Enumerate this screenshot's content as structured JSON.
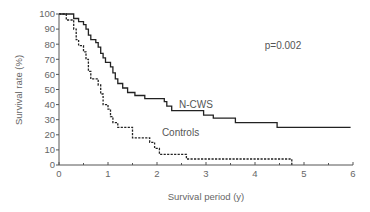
{
  "chart_data": {
    "type": "line",
    "subtype": "kaplan-meier step",
    "title": "",
    "xlabel": "Survival period (y)",
    "ylabel": "Survival rate (%)",
    "xlim": [
      0,
      6
    ],
    "ylim": [
      0,
      100
    ],
    "x_ticks": [
      0,
      1,
      2,
      3,
      4,
      5,
      6
    ],
    "x_minor_ticks": [
      0.5,
      1.5,
      2.5,
      3.5,
      4.5,
      5.5
    ],
    "y_ticks": [
      0,
      10,
      20,
      30,
      40,
      50,
      60,
      70,
      80,
      90,
      100
    ],
    "grid": false,
    "legend": "inline labels",
    "annotations": [
      {
        "text": "p=0.002",
        "x": 4.2,
        "y": 77
      }
    ],
    "series": [
      {
        "name": "N-CWS",
        "style": "solid",
        "color": "#222222",
        "label_pos": {
          "x": 2.45,
          "y": 38
        },
        "points": [
          [
            0,
            100
          ],
          [
            0.3,
            100
          ],
          [
            0.3,
            97
          ],
          [
            0.4,
            97
          ],
          [
            0.4,
            95
          ],
          [
            0.5,
            95
          ],
          [
            0.5,
            93
          ],
          [
            0.55,
            93
          ],
          [
            0.55,
            90
          ],
          [
            0.6,
            90
          ],
          [
            0.6,
            86
          ],
          [
            0.65,
            86
          ],
          [
            0.65,
            83
          ],
          [
            0.75,
            83
          ],
          [
            0.75,
            81
          ],
          [
            0.8,
            81
          ],
          [
            0.8,
            78
          ],
          [
            0.85,
            78
          ],
          [
            0.85,
            74
          ],
          [
            0.9,
            74
          ],
          [
            0.9,
            71
          ],
          [
            0.95,
            71
          ],
          [
            0.95,
            68
          ],
          [
            1.05,
            68
          ],
          [
            1.05,
            65
          ],
          [
            1.1,
            65
          ],
          [
            1.1,
            61
          ],
          [
            1.15,
            61
          ],
          [
            1.15,
            57
          ],
          [
            1.2,
            57
          ],
          [
            1.2,
            54
          ],
          [
            1.3,
            54
          ],
          [
            1.3,
            51
          ],
          [
            1.4,
            51
          ],
          [
            1.4,
            48
          ],
          [
            1.55,
            48
          ],
          [
            1.55,
            46
          ],
          [
            1.75,
            46
          ],
          [
            1.75,
            44
          ],
          [
            2.15,
            44
          ],
          [
            2.15,
            42
          ],
          [
            2.2,
            42
          ],
          [
            2.2,
            39
          ],
          [
            2.3,
            39
          ],
          [
            2.3,
            36
          ],
          [
            2.95,
            36
          ],
          [
            2.95,
            33
          ],
          [
            3.15,
            33
          ],
          [
            3.15,
            31
          ],
          [
            3.6,
            31
          ],
          [
            3.6,
            28
          ],
          [
            4.45,
            28
          ],
          [
            4.45,
            25
          ],
          [
            5.95,
            25
          ]
        ]
      },
      {
        "name": "Controls",
        "style": "dashed",
        "color": "#222222",
        "label_pos": {
          "x": 2.1,
          "y": 19
        },
        "points": [
          [
            0,
            100
          ],
          [
            0.15,
            100
          ],
          [
            0.15,
            96
          ],
          [
            0.3,
            96
          ],
          [
            0.3,
            90
          ],
          [
            0.35,
            90
          ],
          [
            0.35,
            83
          ],
          [
            0.4,
            83
          ],
          [
            0.4,
            79
          ],
          [
            0.5,
            79
          ],
          [
            0.5,
            75
          ],
          [
            0.55,
            75
          ],
          [
            0.55,
            70
          ],
          [
            0.6,
            70
          ],
          [
            0.6,
            62
          ],
          [
            0.65,
            62
          ],
          [
            0.65,
            57
          ],
          [
            0.8,
            57
          ],
          [
            0.8,
            53
          ],
          [
            0.85,
            53
          ],
          [
            0.85,
            47
          ],
          [
            0.9,
            47
          ],
          [
            0.9,
            40
          ],
          [
            1.0,
            40
          ],
          [
            1.0,
            37
          ],
          [
            1.05,
            37
          ],
          [
            1.05,
            32
          ],
          [
            1.1,
            32
          ],
          [
            1.1,
            28
          ],
          [
            1.2,
            28
          ],
          [
            1.2,
            25
          ],
          [
            1.5,
            25
          ],
          [
            1.5,
            18
          ],
          [
            1.85,
            18
          ],
          [
            1.85,
            15
          ],
          [
            1.95,
            15
          ],
          [
            1.95,
            11
          ],
          [
            2.05,
            11
          ],
          [
            2.05,
            7
          ],
          [
            2.6,
            7
          ],
          [
            2.6,
            4
          ],
          [
            4.75,
            4
          ],
          [
            4.75,
            0
          ]
        ]
      }
    ]
  }
}
